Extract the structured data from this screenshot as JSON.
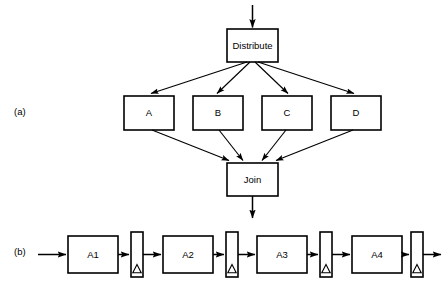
{
  "figure": {
    "background_color": "#ffffff",
    "line_color": "#000000",
    "width": 448,
    "height": 281
  },
  "parts": [
    {
      "id": "a",
      "label": "(a)",
      "x": 14,
      "y": 112
    },
    {
      "id": "b",
      "label": "(b)",
      "x": 14,
      "y": 252
    }
  ],
  "panel_a": {
    "distribute": {
      "label": "Distribute",
      "x": 227,
      "y": 29,
      "w": 51,
      "h": 33,
      "cx": 252.5,
      "cy": 45.5
    },
    "join": {
      "label": "Join",
      "x": 227,
      "y": 163,
      "w": 51,
      "h": 33,
      "cx": 252.5,
      "cy": 179.5
    },
    "branches": [
      {
        "label": "A",
        "x": 124,
        "y": 96,
        "w": 50,
        "h": 34,
        "cx": 149,
        "cy": 113
      },
      {
        "label": "B",
        "x": 193,
        "y": 96,
        "w": 50,
        "h": 34,
        "cx": 218,
        "cy": 113
      },
      {
        "label": "C",
        "x": 262,
        "y": 96,
        "w": 50,
        "h": 34,
        "cx": 287,
        "cy": 113
      },
      {
        "label": "D",
        "x": 331,
        "y": 96,
        "w": 50,
        "h": 34,
        "cx": 356,
        "cy": 113
      }
    ],
    "input_arrow": {
      "x": 252.5,
      "y1": 5,
      "y2": 29
    },
    "output_arrow": {
      "x": 252.5,
      "y1": 196,
      "y2": 220
    },
    "fan_out_origin": {
      "x": 252.5,
      "y": 62
    },
    "fan_in_targets": [
      {
        "x": 231,
        "y": 163
      },
      {
        "x": 244,
        "y": 163
      },
      {
        "x": 261,
        "y": 163
      },
      {
        "x": 274,
        "y": 163
      }
    ]
  },
  "panel_b": {
    "stages": [
      {
        "label": "A1",
        "x": 68,
        "y": 236,
        "w": 50,
        "h": 37,
        "cx": 93,
        "cy": 254.5
      },
      {
        "label": "A2",
        "x": 163,
        "y": 236,
        "w": 50,
        "h": 37,
        "cx": 188,
        "cy": 254.5
      },
      {
        "label": "A3",
        "x": 257,
        "y": 236,
        "w": 50,
        "h": 37,
        "cx": 282,
        "cy": 254.5
      },
      {
        "label": "A4",
        "x": 352,
        "y": 236,
        "w": 50,
        "h": 37,
        "cx": 377,
        "cy": 254.5
      }
    ],
    "buffers": [
      {
        "name": "buffer-1",
        "x": 131,
        "y": 232,
        "w": 12,
        "h": 45,
        "symbol": "delta"
      },
      {
        "name": "buffer-2",
        "x": 226,
        "y": 232,
        "w": 12,
        "h": 45,
        "symbol": "delta"
      },
      {
        "name": "buffer-3",
        "x": 320,
        "y": 232,
        "w": 12,
        "h": 45,
        "symbol": "delta"
      },
      {
        "name": "buffer-4",
        "x": 411,
        "y": 232,
        "w": 12,
        "h": 45,
        "symbol": "delta"
      }
    ],
    "baseline_y": 254.5,
    "input_arrow": {
      "x1": 38,
      "x2": 68
    },
    "output_arrow": {
      "x1": 423,
      "x2": 441
    },
    "connectors": [
      {
        "x1": 118,
        "x2": 131
      },
      {
        "x1": 143,
        "x2": 163
      },
      {
        "x1": 213,
        "x2": 226
      },
      {
        "x1": 238,
        "x2": 257
      },
      {
        "x1": 307,
        "x2": 320
      },
      {
        "x1": 332,
        "x2": 352
      },
      {
        "x1": 402,
        "x2": 411
      }
    ]
  }
}
